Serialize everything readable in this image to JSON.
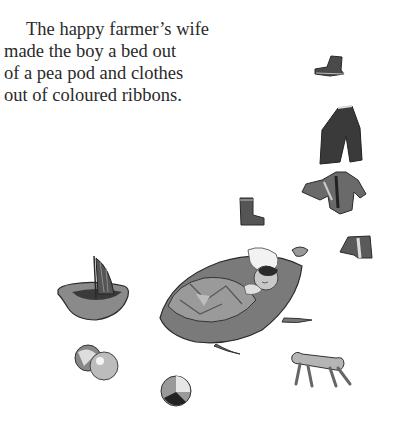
{
  "page": {
    "paragraph_lines": [
      "The happy farmer’s wife",
      "made the boy a bed out",
      "of a pea pod and clothes",
      "out of coloured ribbons."
    ]
  },
  "illustration": {
    "description": "Boy sleeping in a pea pod bed under a patchwork quilt, surrounded by tiny clothes and toys",
    "items": [
      "boot",
      "trousers",
      "jacket",
      "boot",
      "shirt",
      "walnut-shell-boat",
      "pea-pod-bed",
      "sleeping-boy",
      "marbles",
      "ball",
      "stool"
    ]
  }
}
